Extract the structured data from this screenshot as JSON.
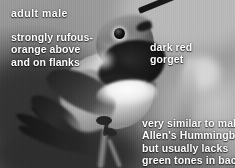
{
  "figure": {
    "rendering": "black-and-white field guide photograph"
  },
  "labels": {
    "age_sex": "adult male",
    "upperparts": "strongly rufous-\norange above\nand on flanks",
    "gorget": "dark red\ngorget",
    "comparison": "very similar to male\nAllen's Hummingbird,\nbut usually lacks\ngreen tones in back"
  },
  "colors": {
    "label_text": "#ffffff",
    "gorget_dark": "#1a1a1a",
    "breast_pale": "#f2f2f2",
    "background_mid": "#8d8d8d",
    "background_dark": "#3c3c3c"
  },
  "anatomy": {
    "bill": "bill",
    "eye": "eye",
    "crown": "crown",
    "gorget": "gorget",
    "breast": "breast",
    "wing": "wing",
    "tail": "tail",
    "foot": "foot",
    "perch": "perch"
  }
}
